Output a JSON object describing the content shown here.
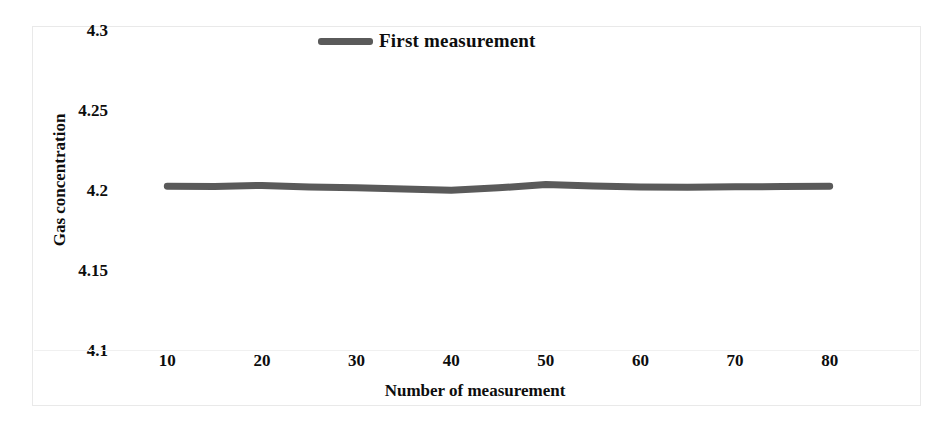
{
  "chart_data": {
    "type": "line",
    "title": "",
    "xlabel": "Number of measurement",
    "ylabel": "Gas concentration",
    "xlim": [
      5,
      85
    ],
    "ylim": [
      4.1,
      4.3
    ],
    "xticks": [
      10,
      20,
      30,
      40,
      50,
      60,
      70,
      80
    ],
    "yticks": [
      4.1,
      4.15,
      4.2,
      4.25,
      4.3
    ],
    "xtick_labels": [
      "10",
      "20",
      "30",
      "40",
      "50",
      "60",
      "70",
      "80"
    ],
    "ytick_labels": [
      "4.1",
      "4.15",
      "4.2",
      "4.25",
      "4.3"
    ],
    "grid": false,
    "legend_position": "top-center",
    "series": [
      {
        "name": "First measurement",
        "color": "#5a5a5a",
        "line_width": 7,
        "x": [
          10,
          15,
          20,
          25,
          30,
          35,
          40,
          45,
          50,
          55,
          60,
          65,
          70,
          75,
          80
        ],
        "values": [
          4.203,
          4.2028,
          4.2035,
          4.2025,
          4.202,
          4.2012,
          4.2005,
          4.202,
          4.204,
          4.2032,
          4.2025,
          4.2024,
          4.2026,
          4.2028,
          4.203
        ]
      }
    ]
  },
  "legend": {
    "entries": [
      {
        "label": "First measurement",
        "color": "#5a5a5a"
      }
    ]
  },
  "axes": {
    "y_title": "Gas concentration",
    "x_title": "Number of measurement"
  },
  "colors": {
    "series_gray": "#5a5a5a",
    "text": "#0d0d0d",
    "frame": "#e9e9e9",
    "background": "#ffffff"
  }
}
